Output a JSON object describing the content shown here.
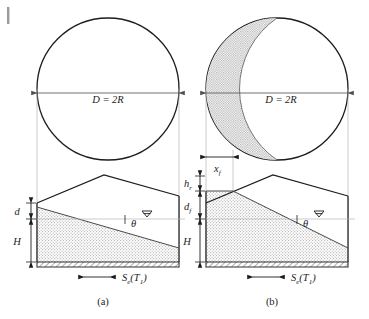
{
  "figure": {
    "type": "engineering-diagram",
    "panels": [
      {
        "id": "a",
        "caption": "(a)",
        "plan_view": {
          "shape": "circle",
          "diameter_label": "D = 2R",
          "shaded_region": false
        },
        "section_view": {
          "dimensions": [
            {
              "name": "d",
              "label": "d"
            },
            {
              "name": "H",
              "label": "H"
            }
          ],
          "angle_label": "θ",
          "water_table_symbol": "water-table-triangle",
          "base_load_label": "S",
          "base_load_sub": "e",
          "base_load_arg": "(T",
          "base_load_arg_sub": "1",
          "base_load_close": ")"
        }
      },
      {
        "id": "b",
        "caption": "(b)",
        "plan_view": {
          "shape": "circle",
          "diameter_label": "D = 2R",
          "shaded_region": true,
          "breach_width_label": "x",
          "breach_width_sub": "f"
        },
        "section_view": {
          "dimensions": [
            {
              "name": "h_r",
              "label": "h",
              "sub": "r"
            },
            {
              "name": "d_f",
              "label": "d",
              "sub": "f"
            },
            {
              "name": "H",
              "label": "H",
              "sub": ""
            }
          ],
          "angle_label": "θ",
          "water_table_symbol": "water-table-triangle",
          "base_load_label": "S",
          "base_load_sub": "e",
          "base_load_arg": "(T",
          "base_load_arg_sub": "1",
          "base_load_close": ")"
        }
      }
    ],
    "colors": {
      "line": "#1c1c1c",
      "thin_line": "#8a8a8a",
      "fill_stipple": "#d8d8d8",
      "background": "#ffffff",
      "crescent_fill": "#d0d0d0"
    }
  }
}
